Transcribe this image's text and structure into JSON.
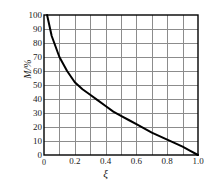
{
  "chart_data": {
    "type": "line",
    "title": "",
    "xlabel": "ξ",
    "ylabel": "M/%",
    "xlim": [
      0,
      1.0
    ],
    "ylim": [
      0,
      100
    ],
    "grid": true,
    "legend": "none",
    "x_major_ticks": [
      0,
      0.2,
      0.4,
      0.6,
      0.8,
      1.0
    ],
    "x_tick_labels": [
      "0",
      "0.2",
      "0.4",
      "0.6",
      "0.8",
      "1.0"
    ],
    "x_gridline_step": 0.1,
    "y_major_ticks": [
      0,
      10,
      20,
      30,
      40,
      50,
      60,
      70,
      80,
      90,
      100
    ],
    "y_tick_labels": [
      "0",
      "10",
      "20",
      "30",
      "40",
      "50",
      "60",
      "70",
      "80",
      "90",
      "100"
    ],
    "y_gridline_step": 10,
    "series": [
      {
        "name": "M",
        "x": [
          0.02,
          0.05,
          0.1,
          0.15,
          0.2,
          0.25,
          0.3,
          0.35,
          0.4,
          0.45,
          0.5,
          0.55,
          0.6,
          0.65,
          0.7,
          0.75,
          0.8,
          0.85,
          0.9,
          0.95,
          1.0
        ],
        "values": [
          100,
          85,
          70,
          60,
          52,
          47,
          43,
          39,
          35,
          31,
          28,
          25,
          22,
          19,
          16,
          13.5,
          11,
          8.5,
          6,
          3,
          0
        ]
      }
    ],
    "colors": {
      "curve": "#000000",
      "grid": "#8c8c8c",
      "axis": "#000000",
      "background": "#ffffff",
      "text": "#1a1a1a"
    }
  }
}
